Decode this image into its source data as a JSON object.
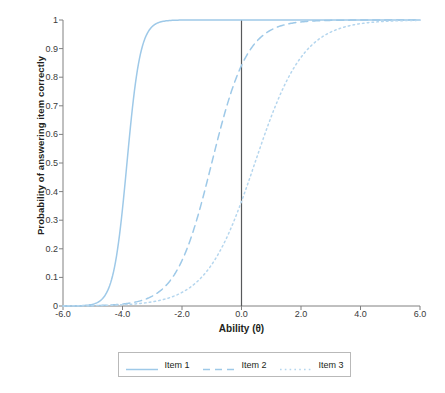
{
  "chart_data": {
    "type": "line",
    "title": "",
    "xlabel": "Ability (θ)",
    "ylabel": "Probability of answering item correctly",
    "xlim": [
      -6.0,
      6.0
    ],
    "ylim": [
      0,
      1
    ],
    "grid": false,
    "legend_position": "bottom",
    "xticks": [
      "-6.0",
      "-4.0",
      "-2.0",
      "0.0",
      "2.0",
      "4.0",
      "6.0"
    ],
    "xtick_values": [
      -6.0,
      -4.0,
      -2.0,
      0.0,
      2.0,
      4.0,
      6.0
    ],
    "yticks": [
      "0",
      "0.1",
      "0.2",
      "0.3",
      "0.4",
      "0.5",
      "0.6",
      "0.7",
      "0.8",
      "0.9",
      "1"
    ],
    "ytick_values": [
      0,
      0.1,
      0.2,
      0.3,
      0.4,
      0.5,
      0.6,
      0.7,
      0.8,
      0.9,
      1
    ],
    "annotations": [
      {
        "name": "vertical-reference-line",
        "x": 0.0,
        "color": "#58595b"
      }
    ],
    "series": [
      {
        "name": "Item 1",
        "style": "solid",
        "color": "#9ec9e8",
        "model": "2PL",
        "difficulty_b": -3.85,
        "discrimination_a": 2.6,
        "x": [
          -6.0,
          -5.5,
          -5.0,
          -4.75,
          -4.5,
          -4.25,
          -4.0,
          -3.85,
          -3.75,
          -3.5,
          -3.25,
          -3.0,
          -2.75,
          -2.5,
          -2.0,
          -1.5,
          -1.0,
          -0.5,
          0.0,
          1.0,
          2.0,
          3.0,
          4.0,
          5.0,
          6.0
        ],
        "y": [
          0.005,
          0.017,
          0.063,
          0.114,
          0.194,
          0.307,
          0.447,
          0.5,
          0.591,
          0.718,
          0.819,
          0.89,
          0.936,
          0.964,
          0.99,
          0.997,
          0.999,
          1.0,
          1.0,
          1.0,
          1.0,
          1.0,
          1.0,
          1.0,
          1.0
        ]
      },
      {
        "name": "Item 2",
        "style": "dashed",
        "color": "#9ec9e8",
        "model": "2PL",
        "difficulty_b": -1.0,
        "discrimination_a": 0.98,
        "x": [
          -6.0,
          -5.5,
          -5.0,
          -4.5,
          -4.0,
          -3.5,
          -3.0,
          -2.5,
          -2.0,
          -1.5,
          -1.0,
          -0.5,
          0.0,
          0.5,
          1.0,
          1.5,
          2.0,
          2.5,
          3.0,
          3.5,
          4.0,
          4.5,
          5.0,
          5.5,
          6.0
        ],
        "y": [
          0.007,
          0.011,
          0.018,
          0.029,
          0.047,
          0.076,
          0.12,
          0.185,
          0.272,
          0.378,
          0.5,
          0.622,
          0.728,
          0.815,
          0.88,
          0.924,
          0.953,
          0.971,
          0.982,
          0.989,
          0.993,
          0.996,
          0.998,
          0.998,
          0.999
        ]
      },
      {
        "name": "Item 3",
        "style": "dotted",
        "color": "#b5d6ee",
        "model": "2PL",
        "difficulty_b": 0.45,
        "discrimination_a": 0.72,
        "x": [
          -6.0,
          -5.5,
          -5.0,
          -4.5,
          -4.0,
          -3.5,
          -3.0,
          -2.5,
          -2.0,
          -1.5,
          -1.0,
          -0.5,
          0.0,
          0.5,
          1.0,
          1.5,
          2.0,
          2.5,
          3.0,
          3.5,
          4.0,
          4.5,
          5.0,
          5.5,
          6.0
        ],
        "y": [
          0.011,
          0.016,
          0.022,
          0.031,
          0.044,
          0.062,
          0.086,
          0.119,
          0.162,
          0.217,
          0.283,
          0.359,
          0.44,
          0.522,
          0.602,
          0.675,
          0.738,
          0.792,
          0.836,
          0.872,
          0.901,
          0.924,
          0.942,
          0.956,
          0.966
        ]
      }
    ],
    "key_readings": [
      {
        "series": "Item 2",
        "x": 0.0,
        "y": 0.85
      },
      {
        "series": "Item 3",
        "x": 0.0,
        "y": 0.39
      }
    ]
  },
  "legend": {
    "entries": [
      {
        "label": "Item 1",
        "style": "solid"
      },
      {
        "label": "Item 2",
        "style": "dashed"
      },
      {
        "label": "Item 3",
        "style": "dotted"
      }
    ]
  },
  "colors": {
    "item1": "#9ec9e8",
    "item2": "#9ec9e8",
    "item3": "#b5d6ee",
    "axis": "#808080",
    "reference_line": "#58595b",
    "text": "#231f20",
    "legend_border": "#b9b9b9"
  }
}
